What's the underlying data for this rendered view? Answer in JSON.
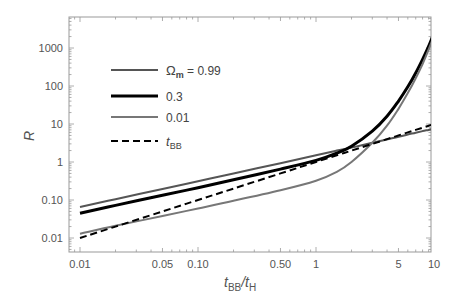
{
  "chart_data": {
    "type": "line",
    "title": "",
    "xlabel": "t_BB/t_H",
    "ylabel": "R",
    "xscale": "log",
    "yscale": "log",
    "xlim": [
      0.0085,
      11
    ],
    "ylim": [
      0.0075,
      4500
    ],
    "grid": false,
    "legend_position": "upper-left",
    "x_ticks": [
      {
        "value": 0.01,
        "label": "0.01"
      },
      {
        "value": 0.05,
        "label": "0.05"
      },
      {
        "value": 0.1,
        "label": "0.10"
      },
      {
        "value": 0.5,
        "label": "0.50"
      },
      {
        "value": 1,
        "label": "1"
      },
      {
        "value": 5,
        "label": "5"
      },
      {
        "value": 10,
        "label": "10"
      }
    ],
    "y_ticks": [
      {
        "value": 0.01,
        "label": "0.01"
      },
      {
        "value": 0.1,
        "label": "0.10"
      },
      {
        "value": 1,
        "label": "1"
      },
      {
        "value": 10,
        "label": "10"
      },
      {
        "value": 100,
        "label": "100"
      },
      {
        "value": 1000,
        "label": "1000"
      }
    ],
    "x": [
      0.01,
      0.02,
      0.05,
      0.1,
      0.2,
      0.5,
      1,
      1.5,
      2,
      3,
      4,
      5,
      6,
      7,
      8,
      9,
      10
    ],
    "series": [
      {
        "name": "Ω_m = 0.99",
        "legend_symbol": "Ω",
        "legend_sub": "m",
        "legend_rest": " = 0.99",
        "color": "#555555",
        "width": 2,
        "dash": "",
        "values": [
          0.066,
          0.105,
          0.195,
          0.31,
          0.5,
          0.93,
          1.5,
          2.0,
          2.4,
          3.2,
          3.9,
          4.6,
          5.3,
          5.9,
          6.5,
          7.0,
          7.5
        ]
      },
      {
        "name": "0.3",
        "legend_symbol": "",
        "legend_sub": "",
        "legend_rest": "0.3",
        "color": "#000000",
        "width": 3,
        "dash": "",
        "values": [
          0.045,
          0.072,
          0.133,
          0.21,
          0.34,
          0.65,
          1.1,
          1.7,
          2.6,
          6.5,
          16,
          40,
          95,
          220,
          500,
          1100,
          2500
        ]
      },
      {
        "name": "0.01",
        "legend_symbol": "",
        "legend_sub": "",
        "legend_rest": "0.01",
        "color": "#777777",
        "width": 2,
        "dash": "",
        "values": [
          0.013,
          0.021,
          0.038,
          0.06,
          0.095,
          0.18,
          0.32,
          0.55,
          1.0,
          3.2,
          9,
          25,
          65,
          160,
          380,
          900,
          2100
        ]
      },
      {
        "name": "t_BB",
        "legend_symbol": "t",
        "legend_sub": "BB",
        "legend_rest": "",
        "color": "#000000",
        "width": 2,
        "dash": "7,4",
        "values": [
          0.01,
          0.02,
          0.05,
          0.1,
          0.2,
          0.5,
          1,
          1.5,
          2,
          3,
          4,
          5,
          6,
          7,
          8,
          9,
          10
        ]
      }
    ]
  },
  "axes": {
    "ylabel": "R",
    "xlabel_main": "t",
    "xlabel_sub1": "BB",
    "xlabel_slash": "/t",
    "xlabel_sub2": "H"
  }
}
